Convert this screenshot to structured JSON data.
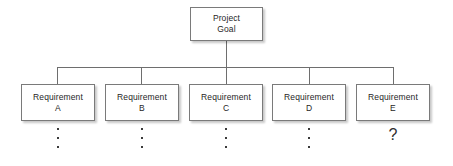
{
  "diagram": {
    "type": "hierarchy-tree",
    "title": "",
    "background_color": "#ffffff",
    "box_border_color": "#7a7a7a",
    "connector_color": "#6e6e6e",
    "text_color": "#262626",
    "root": {
      "line1": "Project",
      "line2": "Goal"
    },
    "requirements": [
      {
        "line1": "Requirement",
        "line2": "A",
        "continuation": "vertical-ellipsis",
        "continuation_glyph": "⋮"
      },
      {
        "line1": "Requirement",
        "line2": "B",
        "continuation": "vertical-ellipsis",
        "continuation_glyph": "⋮"
      },
      {
        "line1": "Requirement",
        "line2": "C",
        "continuation": "vertical-ellipsis",
        "continuation_glyph": "⋮"
      },
      {
        "line1": "Requirement",
        "line2": "D",
        "continuation": "vertical-ellipsis",
        "continuation_glyph": "⋮"
      },
      {
        "line1": "Requirement",
        "line2": "E",
        "continuation": "question-mark",
        "continuation_glyph": "?"
      }
    ]
  }
}
